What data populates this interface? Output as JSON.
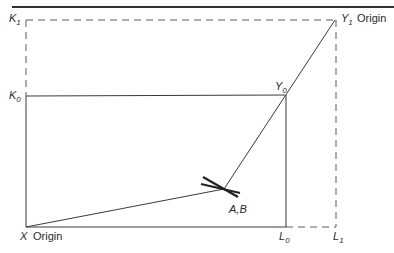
{
  "diagram": {
    "type": "edgeworth-box",
    "top_rule": true,
    "labels": {
      "k1": {
        "main": "K",
        "sub": "1"
      },
      "k0": {
        "main": "K",
        "sub": "0"
      },
      "y1": {
        "main": "Y",
        "sub": "1",
        "suffix": "Origin"
      },
      "y0": {
        "main": "Y",
        "sub": "0"
      },
      "x_origin": {
        "main": "X",
        "suffix": "Origin"
      },
      "l0": {
        "main": "L",
        "sub": "0"
      },
      "l1": {
        "main": "L",
        "sub": "1"
      },
      "ab": "A,B"
    },
    "points": {
      "x_origin": [
        26,
        227
      ],
      "k1": [
        26,
        20
      ],
      "k0": [
        26,
        96
      ],
      "y1": [
        335,
        20
      ],
      "y0": [
        285,
        96
      ],
      "l0": [
        286,
        227
      ],
      "l1": [
        336,
        227
      ],
      "ab": [
        224,
        189
      ]
    },
    "colors": {
      "line": "#3a3a3a",
      "dashed": "#5a5a5a",
      "rule": "#333333"
    }
  }
}
